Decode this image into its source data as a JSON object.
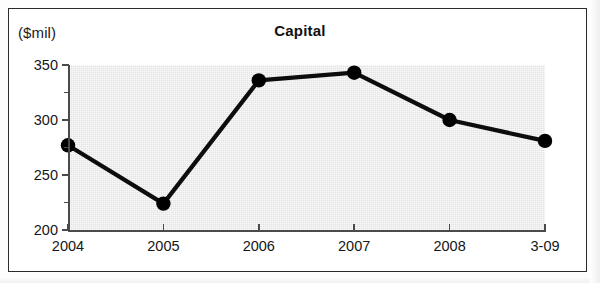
{
  "figure": {
    "unit_label": "($mil)",
    "title": "Capital"
  },
  "chart_data": {
    "type": "line",
    "title": "Capital",
    "subtitle": "",
    "xlabel": "",
    "ylabel": "($mil)",
    "unit": "$mil",
    "categories": [
      "2004",
      "2005",
      "2006",
      "2007",
      "2008",
      "3-09"
    ],
    "values": [
      277,
      224,
      336,
      343,
      300,
      281
    ],
    "series": [
      {
        "name": "Capital",
        "values": [
          277,
          224,
          336,
          343,
          300,
          281
        ]
      }
    ],
    "ylim": [
      200,
      350
    ],
    "y_major_ticks": [
      200,
      250,
      300,
      350
    ],
    "y_minor_ticks": [
      225,
      275,
      325
    ],
    "y_tick_labels": [
      "200",
      "250",
      "300",
      "350"
    ],
    "x_tick_labels": [
      "2004",
      "2005",
      "2006",
      "2007",
      "2008",
      "3-09"
    ],
    "grid": false,
    "legend": false,
    "legend_position": "none",
    "marker": "filled-circle",
    "line_color": "#000000",
    "marker_color": "#000000",
    "plot_background": "#e3e3e3",
    "figure_background": "#ffffff"
  }
}
